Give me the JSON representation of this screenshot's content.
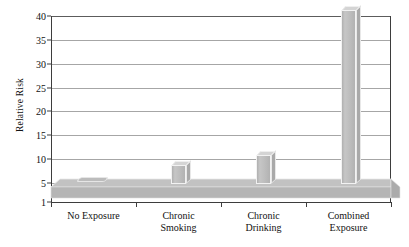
{
  "chart_data": {
    "type": "bar",
    "title": "",
    "subtitle": "",
    "xlabel": "",
    "ylabel": "Relative Risk",
    "categories": [
      "No Exposure",
      "Chronic Smoking",
      "Chronic Drinking",
      "Combined Exposure"
    ],
    "category_lines": [
      [
        "No Exposure"
      ],
      [
        "Chronic",
        "Smoking"
      ],
      [
        "Chronic",
        "Drinking"
      ],
      [
        "Combined",
        "Exposure"
      ]
    ],
    "values": [
      1,
      5,
      7,
      37.5
    ],
    "ylim": [
      1,
      40
    ],
    "yticks": [
      1,
      5,
      10,
      15,
      20,
      25,
      30,
      35,
      40
    ],
    "ytick_labels": [
      "1",
      "5",
      "10",
      "15",
      "20",
      "25",
      "30",
      "35",
      "40"
    ],
    "grid": true,
    "legend": "none",
    "style": "3d-column",
    "colors": {
      "bar_face": "#bdbdbd",
      "bar_top": "#d4d4d4",
      "bar_side": "#a9a9a9",
      "floor": "#b5b5b5",
      "gridline": "#a6a6a6",
      "axis": "#3d3d3d",
      "text": "#121212",
      "background": "#ffffff"
    }
  }
}
